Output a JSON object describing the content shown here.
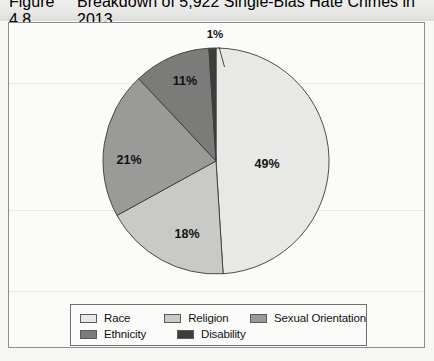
{
  "figure": {
    "number": "Figure 4.8",
    "caption": "Breakdown of 5,922 Single-Bias Hate Crimes in 2013"
  },
  "legend": {
    "rows": [
      [
        {
          "label": "Race",
          "color": "#e8e8e6"
        },
        {
          "label": "Religion",
          "color": "#c9c9c7"
        },
        {
          "label": "Sexual Orientation",
          "color": "#9a9a98"
        }
      ],
      [
        {
          "label": "Ethnicity",
          "color": "#7b7b79"
        },
        {
          "label": "Disability",
          "color": "#3d3d3b"
        }
      ]
    ]
  },
  "chart_data": {
    "type": "pie",
    "title": "Breakdown of 5,922 Single-Bias Hate Crimes in 2013",
    "total": 5922,
    "total_label": "5,922",
    "year": "2013",
    "start_angle_deg": 0,
    "direction": "clockwise",
    "legend_position": "bottom",
    "grid": false,
    "categories": [
      "Race",
      "Religion",
      "Sexual Orientation",
      "Ethnicity",
      "Disability"
    ],
    "values": [
      49,
      18,
      21,
      11,
      1
    ],
    "labels": [
      "49%",
      "18%",
      "21%",
      "11%",
      "1%"
    ],
    "colors": [
      "#e8e8e6",
      "#c9c9c7",
      "#9a9a98",
      "#7b7b79",
      "#3d3d3b"
    ],
    "slices": [
      {
        "name": "Race",
        "value": 49,
        "label": "49%",
        "color": "#e8e8e6",
        "label_x": 258,
        "label_y": 145,
        "callout": false
      },
      {
        "name": "Religion",
        "value": 18,
        "label": "18%",
        "color": "#c9c9c7",
        "label_x": 178,
        "label_y": 215,
        "callout": false
      },
      {
        "name": "Sexual Orientation",
        "value": 21,
        "label": "21%",
        "color": "#9a9a98",
        "label_x": 120,
        "label_y": 141,
        "callout": false
      },
      {
        "name": "Ethnicity",
        "value": 11,
        "label": "11%",
        "color": "#7b7b79",
        "label_x": 176,
        "label_y": 62,
        "callout": false
      },
      {
        "name": "Disability",
        "value": 1,
        "label": "1%",
        "color": "#3d3d3b",
        "label_x": 206,
        "label_y": 15,
        "callout": true
      }
    ]
  }
}
